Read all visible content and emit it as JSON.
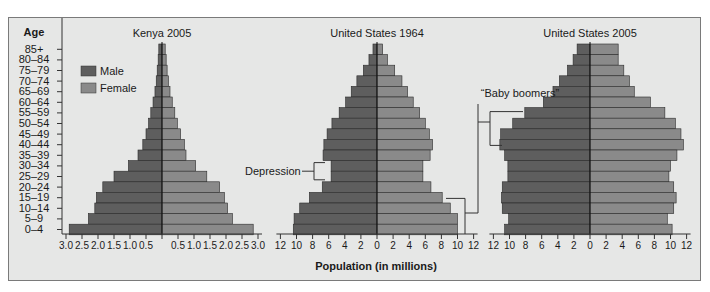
{
  "chart_data": [
    {
      "type": "bar",
      "orientation": "horizontal-population-pyramid",
      "title": "Kenya 2005",
      "categories": [
        "85+",
        "80–84",
        "75–79",
        "70–74",
        "65–69",
        "60–64",
        "55–59",
        "50–54",
        "45–49",
        "40–44",
        "35–39",
        "30–34",
        "25–29",
        "20–24",
        "15–19",
        "10–14",
        "5–9",
        "0–4"
      ],
      "series": [
        {
          "name": "Male",
          "values": [
            0.1,
            0.12,
            0.15,
            0.18,
            0.22,
            0.28,
            0.35,
            0.42,
            0.5,
            0.6,
            0.75,
            1.05,
            1.5,
            1.85,
            2.05,
            2.1,
            2.3,
            2.9
          ]
        },
        {
          "name": "Female",
          "values": [
            0.1,
            0.13,
            0.16,
            0.2,
            0.25,
            0.32,
            0.4,
            0.48,
            0.58,
            0.7,
            0.75,
            1.05,
            1.4,
            1.8,
            1.95,
            2.05,
            2.2,
            2.85
          ]
        }
      ],
      "xlim": [
        3.0,
        3.0
      ],
      "xticks_left": [
        "3.0",
        "2.5",
        "2.0",
        "1.5",
        "1.0",
        "0.5"
      ],
      "xticks_right": [
        "0.5",
        "1.0",
        "1.5",
        "2.0",
        "2.5",
        "3.0"
      ]
    },
    {
      "type": "bar",
      "orientation": "horizontal-population-pyramid",
      "title": "United States 1964",
      "categories": [
        "85+",
        "80–84",
        "75–79",
        "70–74",
        "65–69",
        "60–64",
        "55–59",
        "50–54",
        "45–49",
        "40–44",
        "35–39",
        "30–34",
        "25–29",
        "20–24",
        "15–19",
        "10–14",
        "5–9",
        "0–4"
      ],
      "series": [
        {
          "name": "Male",
          "values": [
            0.5,
            1.0,
            1.7,
            2.5,
            3.2,
            3.9,
            4.7,
            5.6,
            6.2,
            6.6,
            6.7,
            5.7,
            5.7,
            6.8,
            8.4,
            9.6,
            10.3,
            10.4
          ]
        },
        {
          "name": "Female",
          "values": [
            0.7,
            1.3,
            2.2,
            3.1,
            3.8,
            4.5,
            5.3,
            6.0,
            6.5,
            6.9,
            6.6,
            5.7,
            5.7,
            6.7,
            8.1,
            9.1,
            10.0,
            10.0
          ]
        }
      ],
      "xlim": [
        12,
        12
      ],
      "xticks_left": [
        "12",
        "10",
        "8",
        "6",
        "4",
        "2"
      ],
      "xticks_right": [
        "0",
        "2",
        "4",
        "6",
        "8",
        "10",
        "12"
      ]
    },
    {
      "type": "bar",
      "orientation": "horizontal-population-pyramid",
      "title": "United States 2005",
      "categories": [
        "85+",
        "80–84",
        "75–79",
        "70–74",
        "65–69",
        "60–64",
        "55–59",
        "50–54",
        "45–49",
        "40–44",
        "35–39",
        "30–34",
        "25–29",
        "20–24",
        "15–19",
        "10–14",
        "5–9",
        "0–4"
      ],
      "series": [
        {
          "name": "Male",
          "values": [
            1.6,
            2.1,
            2.8,
            3.8,
            4.6,
            5.8,
            8.1,
            9.6,
            11.1,
            11.2,
            10.6,
            10.2,
            10.2,
            10.9,
            11.0,
            10.9,
            10.1,
            10.6
          ]
        },
        {
          "name": "Female",
          "values": [
            3.5,
            3.5,
            4.2,
            4.9,
            5.5,
            7.5,
            9.3,
            10.6,
            11.3,
            11.6,
            10.8,
            10.0,
            9.8,
            10.4,
            10.7,
            10.4,
            9.6,
            10.2
          ]
        }
      ],
      "xlim": [
        12,
        12
      ],
      "xticks_left": [
        "12",
        "10",
        "8",
        "6",
        "4",
        "2"
      ],
      "xticks_right": [
        "0",
        "2",
        "4",
        "6",
        "8",
        "10",
        "12"
      ]
    }
  ],
  "axis": {
    "ylabel": "Age",
    "xlabel": "Population (in millions)",
    "age_groups": [
      "85+",
      "80–84",
      "75–79",
      "70–74",
      "65–69",
      "60–64",
      "55–59",
      "50–54",
      "45–49",
      "40–44",
      "35–39",
      "30–34",
      "25–29",
      "20–24",
      "15–19",
      "10–14",
      "5–9",
      "0–4"
    ]
  },
  "legend": {
    "items": [
      {
        "label": "Male",
        "color": "#5e5e5e"
      },
      {
        "label": "Female",
        "color": "#8a8a8a"
      }
    ],
    "position": "upper-left inside Kenya panel"
  },
  "annotations": {
    "depression": "Depression",
    "baby_boomers": "“Baby boomers”"
  },
  "colors": {
    "male": "#5e5e5e",
    "female": "#8a8a8a",
    "background": "#e6e7e6",
    "outline": "#2a2a2a"
  }
}
